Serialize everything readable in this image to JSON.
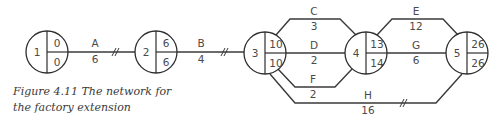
{
  "caption": {
    "line1": "Figure 4.11  The network for",
    "line2": "the factory extension"
  },
  "nodes": [
    {
      "id": "1",
      "early": "0",
      "late": "0"
    },
    {
      "id": "2",
      "early": "6",
      "late": "6"
    },
    {
      "id": "3",
      "early": "10",
      "late": "10"
    },
    {
      "id": "4",
      "early": "13",
      "late": "14"
    },
    {
      "id": "5",
      "early": "26",
      "late": "26"
    }
  ],
  "activities": [
    {
      "name": "A",
      "duration": "6",
      "from": "1",
      "to": "2"
    },
    {
      "name": "B",
      "duration": "4",
      "from": "2",
      "to": "3"
    },
    {
      "name": "C",
      "duration": "3",
      "from": "3",
      "to": "4"
    },
    {
      "name": "D",
      "duration": "2",
      "from": "3",
      "to": "4"
    },
    {
      "name": "F",
      "duration": "2",
      "from": "3",
      "to": "4"
    },
    {
      "name": "E",
      "duration": "12",
      "from": "4",
      "to": "5"
    },
    {
      "name": "G",
      "duration": "6",
      "from": "4",
      "to": "5"
    },
    {
      "name": "H",
      "duration": "16",
      "from": "3",
      "to": "5"
    }
  ]
}
